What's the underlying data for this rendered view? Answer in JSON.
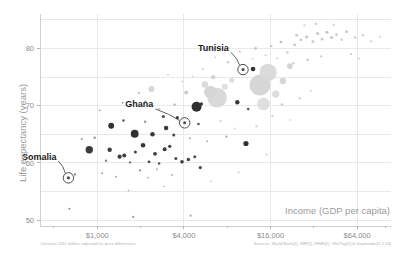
{
  "chart_data": {
    "type": "scatter",
    "title": "",
    "xlabel": "Income (GDP per capita)",
    "ylabel": "Life expectancy (years)",
    "xscale": "log",
    "xlim": [
      400,
      110000
    ],
    "ylim": [
      49,
      86
    ],
    "x_ticks": [
      {
        "value": 1000,
        "label": "$1,000"
      },
      {
        "value": 4000,
        "label": "$4,000"
      },
      {
        "value": 16000,
        "label": "$16,000"
      },
      {
        "value": 64000,
        "label": "$64,000"
      }
    ],
    "x_minor_ticks": [
      500,
      2000,
      8000,
      32000,
      100000
    ],
    "y_ticks": [
      {
        "value": 50,
        "label": "50"
      },
      {
        "value": 60,
        "label": "60"
      },
      {
        "value": 70,
        "label": "70"
      },
      {
        "value": 80,
        "label": "80"
      }
    ],
    "grid": true,
    "legend": "none",
    "notes": {
      "left": "Constant 2011 dollars adjusted for price differences.",
      "right": "Sources: World Bank[1], IMF[1], IHME[1], UN-Pop[1] & Gapminder[1,2,14]"
    },
    "annotations": [
      {
        "label": "Tunisia",
        "x": 10300,
        "y": 76.3,
        "label_x": 8200,
        "label_y": 79.6
      },
      {
        "label": "Ghana",
        "x": 4050,
        "y": 67.0,
        "label_x": 2450,
        "label_y": 69.7
      },
      {
        "label": "Somalia",
        "x": 630,
        "y": 57.4,
        "label_x": 520,
        "label_y": 60.6
      }
    ],
    "points": [
      {
        "x": 640,
        "y": 52.0,
        "r": 1.0,
        "c": "#7a7a7a"
      },
      {
        "x": 1780,
        "y": 50.6,
        "r": 1.1,
        "c": "#8a8a8a"
      },
      {
        "x": 4450,
        "y": 50.8,
        "r": 1.1,
        "c": "#9a9a9a"
      },
      {
        "x": 700,
        "y": 58.0,
        "r": 1.1,
        "c": "#6e6e6e"
      },
      {
        "x": 630,
        "y": 57.4,
        "r": 1.6,
        "c": "#3c3c3c"
      },
      {
        "x": 880,
        "y": 62.3,
        "r": 3.7,
        "c": "#2a2a2a"
      },
      {
        "x": 1220,
        "y": 62.3,
        "r": 2.2,
        "c": "#2e2e2e"
      },
      {
        "x": 960,
        "y": 64.4,
        "r": 1.2,
        "c": "#8f8f8f"
      },
      {
        "x": 1150,
        "y": 60.4,
        "r": 1.2,
        "c": "#7d7d7d"
      },
      {
        "x": 1430,
        "y": 61.1,
        "r": 2.1,
        "c": "#2b2b2b"
      },
      {
        "x": 1540,
        "y": 61.3,
        "r": 2.0,
        "c": "#303030"
      },
      {
        "x": 1690,
        "y": 60.1,
        "r": 1.2,
        "c": "#6a6a6a"
      },
      {
        "x": 1840,
        "y": 61.9,
        "r": 1.5,
        "c": "#333333"
      },
      {
        "x": 2080,
        "y": 63.1,
        "r": 2.3,
        "c": "#262626"
      },
      {
        "x": 2290,
        "y": 60.2,
        "r": 1.4,
        "c": "#3a3a3a"
      },
      {
        "x": 2520,
        "y": 61.6,
        "r": 1.9,
        "c": "#2a2a2a"
      },
      {
        "x": 2690,
        "y": 59.9,
        "r": 1.3,
        "c": "#4a4a4a"
      },
      {
        "x": 2940,
        "y": 62.4,
        "r": 2.0,
        "c": "#2d2d2d"
      },
      {
        "x": 3190,
        "y": 62.9,
        "r": 1.7,
        "c": "#333333"
      },
      {
        "x": 3520,
        "y": 60.8,
        "r": 1.5,
        "c": "#3b3b3b"
      },
      {
        "x": 3880,
        "y": 60.2,
        "r": 1.8,
        "c": "#2f2f2f"
      },
      {
        "x": 4300,
        "y": 60.6,
        "r": 1.7,
        "c": "#343434"
      },
      {
        "x": 4760,
        "y": 61.1,
        "r": 1.5,
        "c": "#3f3f3f"
      },
      {
        "x": 5200,
        "y": 59.2,
        "r": 1.6,
        "c": "#353535"
      },
      {
        "x": 1980,
        "y": 58.7,
        "r": 1.1,
        "c": "#8a8a8a"
      },
      {
        "x": 2600,
        "y": 58.9,
        "r": 1.1,
        "c": "#b0b0b0"
      },
      {
        "x": 1820,
        "y": 65.1,
        "r": 3.9,
        "c": "#1e1e1e"
      },
      {
        "x": 2420,
        "y": 65.0,
        "r": 2.3,
        "c": "#2a2a2a"
      },
      {
        "x": 3010,
        "y": 66.1,
        "r": 2.2,
        "c": "#262626"
      },
      {
        "x": 3400,
        "y": 64.9,
        "r": 1.5,
        "c": "#3a3a3a"
      },
      {
        "x": 1250,
        "y": 66.5,
        "r": 2.9,
        "c": "#1f1f1f"
      },
      {
        "x": 1520,
        "y": 67.4,
        "r": 1.3,
        "c": "#4d4d4d"
      },
      {
        "x": 2150,
        "y": 67.2,
        "r": 1.2,
        "c": "#8c8c8c"
      },
      {
        "x": 2880,
        "y": 68.1,
        "r": 1.5,
        "c": "#3c3c3c"
      },
      {
        "x": 3600,
        "y": 67.9,
        "r": 1.6,
        "c": "#2e2e2e"
      },
      {
        "x": 4050,
        "y": 67.0,
        "r": 1.5,
        "c": "#3a3a3a"
      },
      {
        "x": 1040,
        "y": 69.2,
        "r": 1.0,
        "c": "#a5a5a5"
      },
      {
        "x": 1500,
        "y": 70.5,
        "r": 1.0,
        "c": "#9c9c9c"
      },
      {
        "x": 2160,
        "y": 70.7,
        "r": 1.2,
        "c": "#8b8b8b"
      },
      {
        "x": 2700,
        "y": 69.4,
        "r": 1.1,
        "c": "#b5b5b5"
      },
      {
        "x": 1950,
        "y": 72.2,
        "r": 1.0,
        "c": "#a9a9a9"
      },
      {
        "x": 3450,
        "y": 70.2,
        "r": 1.1,
        "c": "#9e9e9e"
      },
      {
        "x": 2380,
        "y": 72.9,
        "r": 3.0,
        "c": "#d4d4d4"
      },
      {
        "x": 4150,
        "y": 72.3,
        "r": 2.0,
        "c": "#c9c9c9"
      },
      {
        "x": 4900,
        "y": 69.8,
        "r": 5.0,
        "c": "#1c1c1c"
      },
      {
        "x": 5300,
        "y": 70.3,
        "r": 1.6,
        "c": "#2a2a2a"
      },
      {
        "x": 5050,
        "y": 66.8,
        "r": 1.3,
        "c": "#444444"
      },
      {
        "x": 5600,
        "y": 73.7,
        "r": 3.2,
        "c": "#d9d9d9"
      },
      {
        "x": 6100,
        "y": 72.4,
        "r": 6.2,
        "c": "#d2d2d2"
      },
      {
        "x": 6800,
        "y": 71.4,
        "r": 9.8,
        "c": "#d6d6d6"
      },
      {
        "x": 7700,
        "y": 73.3,
        "r": 3.0,
        "c": "#dcdcdc"
      },
      {
        "x": 6400,
        "y": 75.0,
        "r": 2.1,
        "c": "#cccccc"
      },
      {
        "x": 8600,
        "y": 74.4,
        "r": 2.4,
        "c": "#d8d8d8"
      },
      {
        "x": 10300,
        "y": 76.3,
        "r": 1.6,
        "c": "#404040"
      },
      {
        "x": 12100,
        "y": 76.4,
        "r": 2.3,
        "c": "#1f1f1f"
      },
      {
        "x": 9400,
        "y": 70.6,
        "r": 2.2,
        "c": "#262626"
      },
      {
        "x": 13500,
        "y": 73.6,
        "r": 10.5,
        "c": "#d2d2d2"
      },
      {
        "x": 15400,
        "y": 75.8,
        "r": 8.6,
        "c": "#d8d8d8"
      },
      {
        "x": 14300,
        "y": 70.3,
        "r": 6.4,
        "c": "#dcdcdc"
      },
      {
        "x": 11200,
        "y": 69.4,
        "r": 1.4,
        "c": "#555555"
      },
      {
        "x": 17400,
        "y": 72.0,
        "r": 3.6,
        "c": "#dadada"
      },
      {
        "x": 19500,
        "y": 74.3,
        "r": 3.2,
        "c": "#d4d4d4"
      },
      {
        "x": 21800,
        "y": 76.9,
        "r": 2.8,
        "c": "#d0d0d0"
      },
      {
        "x": 9800,
        "y": 79.4,
        "r": 1.1,
        "c": "#c4c4c4"
      },
      {
        "x": 12600,
        "y": 80.0,
        "r": 1.3,
        "c": "#bdbdbd"
      },
      {
        "x": 16200,
        "y": 80.4,
        "r": 1.2,
        "c": "#c0c0c0"
      },
      {
        "x": 18900,
        "y": 81.1,
        "r": 1.4,
        "c": "#bababa"
      },
      {
        "x": 21000,
        "y": 79.3,
        "r": 1.2,
        "c": "#c6c6c6"
      },
      {
        "x": 23500,
        "y": 80.6,
        "r": 1.4,
        "c": "#c2c2c2"
      },
      {
        "x": 26000,
        "y": 81.5,
        "r": 1.3,
        "c": "#bdbdbd"
      },
      {
        "x": 24300,
        "y": 82.3,
        "r": 1.5,
        "c": "#c8c8c8"
      },
      {
        "x": 28500,
        "y": 82.0,
        "r": 1.6,
        "c": "#c4c4c4"
      },
      {
        "x": 31500,
        "y": 81.2,
        "r": 1.5,
        "c": "#c9c9c9"
      },
      {
        "x": 34000,
        "y": 82.6,
        "r": 1.5,
        "c": "#c0c0c0"
      },
      {
        "x": 36500,
        "y": 81.6,
        "r": 1.4,
        "c": "#c6c6c6"
      },
      {
        "x": 39500,
        "y": 82.8,
        "r": 1.5,
        "c": "#bfbfbf"
      },
      {
        "x": 42500,
        "y": 81.9,
        "r": 1.6,
        "c": "#c3c3c3"
      },
      {
        "x": 46000,
        "y": 82.4,
        "r": 1.4,
        "c": "#c8c8c8"
      },
      {
        "x": 50000,
        "y": 81.5,
        "r": 1.3,
        "c": "#cccccc"
      },
      {
        "x": 54000,
        "y": 82.9,
        "r": 1.4,
        "c": "#c4c4c4"
      },
      {
        "x": 44000,
        "y": 84.1,
        "r": 1.2,
        "c": "#cfcfcf"
      },
      {
        "x": 33000,
        "y": 84.3,
        "r": 1.3,
        "c": "#c8c8c8"
      },
      {
        "x": 27500,
        "y": 84.0,
        "r": 1.1,
        "c": "#d0d0d0"
      },
      {
        "x": 62000,
        "y": 81.9,
        "r": 1.3,
        "c": "#cacaca"
      },
      {
        "x": 70000,
        "y": 82.3,
        "r": 1.2,
        "c": "#cdcdcd"
      },
      {
        "x": 80000,
        "y": 81.2,
        "r": 1.2,
        "c": "#d2d2d2"
      },
      {
        "x": 92000,
        "y": 82.0,
        "r": 1.1,
        "c": "#d4d4d4"
      },
      {
        "x": 58000,
        "y": 79.0,
        "r": 1.2,
        "c": "#cfcfcf"
      },
      {
        "x": 66000,
        "y": 78.2,
        "r": 1.1,
        "c": "#d6d6d6"
      },
      {
        "x": 36000,
        "y": 78.6,
        "r": 1.2,
        "c": "#cdcdcd"
      },
      {
        "x": 29000,
        "y": 78.0,
        "r": 1.3,
        "c": "#c9c9c9"
      },
      {
        "x": 23000,
        "y": 77.4,
        "r": 1.2,
        "c": "#cfcfcf"
      },
      {
        "x": 17800,
        "y": 78.3,
        "r": 1.1,
        "c": "#d2d2d2"
      },
      {
        "x": 14800,
        "y": 78.8,
        "r": 1.1,
        "c": "#cccccc"
      },
      {
        "x": 12000,
        "y": 78.2,
        "r": 1.0,
        "c": "#d5d5d5"
      },
      {
        "x": 19200,
        "y": 70.2,
        "r": 1.3,
        "c": "#c8c8c8"
      },
      {
        "x": 25500,
        "y": 71.3,
        "r": 1.2,
        "c": "#d0d0d0"
      },
      {
        "x": 30500,
        "y": 72.6,
        "r": 1.1,
        "c": "#d4d4d4"
      },
      {
        "x": 16500,
        "y": 68.2,
        "r": 1.2,
        "c": "#cfcfcf"
      },
      {
        "x": 22000,
        "y": 67.5,
        "r": 1.1,
        "c": "#d8d8d8"
      },
      {
        "x": 12800,
        "y": 66.4,
        "r": 1.2,
        "c": "#d2d2d2"
      },
      {
        "x": 9000,
        "y": 66.0,
        "r": 1.1,
        "c": "#d6d6d6"
      },
      {
        "x": 7200,
        "y": 67.3,
        "r": 1.1,
        "c": "#cfcfcf"
      },
      {
        "x": 8100,
        "y": 77.6,
        "r": 1.2,
        "c": "#c8c8c8"
      },
      {
        "x": 6600,
        "y": 78.4,
        "r": 1.0,
        "c": "#d2d2d2"
      },
      {
        "x": 5400,
        "y": 76.4,
        "r": 1.1,
        "c": "#cccccc"
      },
      {
        "x": 4600,
        "y": 75.1,
        "r": 1.0,
        "c": "#d6d6d6"
      },
      {
        "x": 3900,
        "y": 74.2,
        "r": 1.0,
        "c": "#d4d4d4"
      },
      {
        "x": 3100,
        "y": 75.4,
        "r": 1.0,
        "c": "#d8d8d8"
      },
      {
        "x": 10800,
        "y": 63.4,
        "r": 2.6,
        "c": "#1e1e1e"
      },
      {
        "x": 7900,
        "y": 64.6,
        "r": 1.1,
        "c": "#9a9a9a"
      },
      {
        "x": 15000,
        "y": 61.5,
        "r": 1.0,
        "c": "#c2c2c2"
      },
      {
        "x": 9600,
        "y": 58.4,
        "r": 1.0,
        "c": "#c8c8c8"
      },
      {
        "x": 780,
        "y": 64.2,
        "r": 1.0,
        "c": "#8e8e8e"
      },
      {
        "x": 1080,
        "y": 58.2,
        "r": 1.0,
        "c": "#9a9a9a"
      },
      {
        "x": 1350,
        "y": 57.6,
        "r": 1.0,
        "c": "#a0a0a0"
      },
      {
        "x": 2250,
        "y": 57.4,
        "r": 1.0,
        "c": "#b6b6b6"
      },
      {
        "x": 3300,
        "y": 57.9,
        "r": 1.0,
        "c": "#adadad"
      },
      {
        "x": 5800,
        "y": 63.8,
        "r": 1.0,
        "c": "#b2b2b2"
      },
      {
        "x": 4400,
        "y": 64.3,
        "r": 1.0,
        "c": "#a8a8a8"
      },
      {
        "x": 2900,
        "y": 55.9,
        "r": 0.9,
        "c": "#c0c0c0"
      },
      {
        "x": 1650,
        "y": 55.2,
        "r": 0.9,
        "c": "#bcbcbc"
      },
      {
        "x": 6200,
        "y": 56.8,
        "r": 0.9,
        "c": "#c4c4c4"
      }
    ]
  }
}
